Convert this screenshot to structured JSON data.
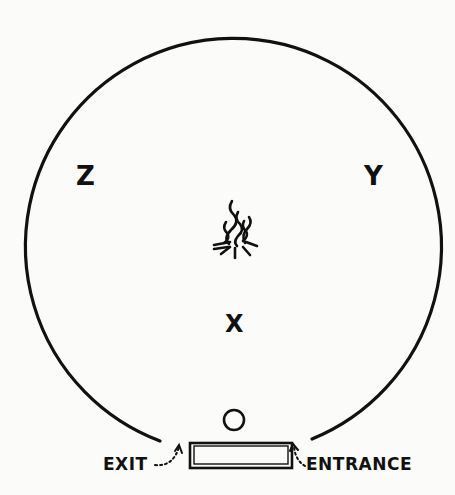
{
  "diagram": {
    "positions": {
      "z": "Z",
      "y": "Y",
      "x": "X",
      "o": "O"
    },
    "labels": {
      "exit": "EXIT",
      "entrance": "ENTRANCE"
    },
    "icons": {
      "center": "campfire-icon",
      "door": "doorway-rectangle"
    },
    "colors": {
      "ink": "#111111",
      "paper": "#fbfbfa"
    }
  }
}
